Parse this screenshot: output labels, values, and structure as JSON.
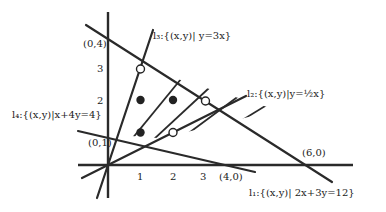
{
  "diagram": {
    "type": "linear-programming feasible region",
    "axes": {
      "origin_px": [
        108,
        165
      ],
      "unit_px": 32.5,
      "x_ticks": [
        "1",
        "2",
        "3"
      ],
      "y_ticks": [
        "2",
        "3"
      ]
    },
    "intercept_labels": {
      "y4": "(0,4)",
      "y1": "(0,1)",
      "x4": "(4,0)",
      "x6": "(6,0)"
    },
    "lines": [
      {
        "id": "l1",
        "label": "l₁:{(x,y)| 2x+3y=12}",
        "equation": "2x+3y=12"
      },
      {
        "id": "l2",
        "label": "l₂:{(x,y)|y=½x}",
        "equation": "y=x/2"
      },
      {
        "id": "l3",
        "label": "l₃:{(x,y)| y=3x}",
        "equation": "y=3x"
      },
      {
        "id": "l4",
        "label": "l₄:{(x,y)|x+4y=4}",
        "equation": "x+4y=4"
      }
    ],
    "points_filled": [
      [
        1,
        2
      ],
      [
        2,
        2
      ],
      [
        1,
        1
      ]
    ],
    "points_open": [
      [
        1,
        3
      ],
      [
        3,
        2
      ],
      [
        2,
        1
      ]
    ]
  }
}
